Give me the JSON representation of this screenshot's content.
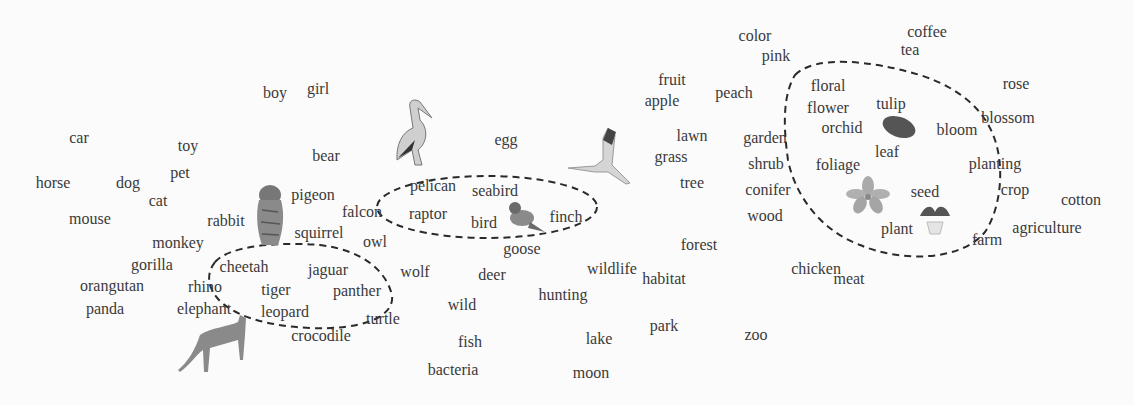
{
  "figure": {
    "type": "word-embedding-map",
    "clusters": [
      {
        "name": "big-cats",
        "members": [
          "cheetah",
          "jaguar",
          "tiger",
          "panther",
          "leopard"
        ]
      },
      {
        "name": "birds",
        "members": [
          "pelican",
          "seabird",
          "raptor",
          "bird",
          "finch"
        ]
      },
      {
        "name": "plants",
        "members": [
          "floral",
          "flower",
          "tulip",
          "orchid",
          "bloom",
          "leaf",
          "foliage",
          "seed",
          "plant"
        ]
      }
    ],
    "words": [
      {
        "text": "color",
        "x": 755,
        "y": 36
      },
      {
        "text": "pink",
        "x": 776,
        "y": 56
      },
      {
        "text": "coffee",
        "x": 927,
        "y": 32
      },
      {
        "text": "tea",
        "x": 910,
        "y": 50
      },
      {
        "text": "boy",
        "x": 275,
        "y": 93
      },
      {
        "text": "girl",
        "x": 318,
        "y": 89
      },
      {
        "text": "fruit",
        "x": 672,
        "y": 80
      },
      {
        "text": "apple",
        "x": 662,
        "y": 101
      },
      {
        "text": "peach",
        "x": 734,
        "y": 93
      },
      {
        "text": "rose",
        "x": 1016,
        "y": 84
      },
      {
        "text": "floral",
        "x": 828,
        "y": 86
      },
      {
        "text": "flower",
        "x": 828,
        "y": 108
      },
      {
        "text": "tulip",
        "x": 891,
        "y": 104
      },
      {
        "text": "orchid",
        "x": 842,
        "y": 128
      },
      {
        "text": "bloom",
        "x": 957,
        "y": 130
      },
      {
        "text": "blossom",
        "x": 1008,
        "y": 118
      },
      {
        "text": "car",
        "x": 79,
        "y": 138
      },
      {
        "text": "toy",
        "x": 188,
        "y": 146
      },
      {
        "text": "egg",
        "x": 506,
        "y": 140
      },
      {
        "text": "lawn",
        "x": 692,
        "y": 136
      },
      {
        "text": "garden",
        "x": 765,
        "y": 138
      },
      {
        "text": "bear",
        "x": 326,
        "y": 156
      },
      {
        "text": "grass",
        "x": 671,
        "y": 157
      },
      {
        "text": "shrub",
        "x": 766,
        "y": 164
      },
      {
        "text": "leaf",
        "x": 887,
        "y": 152
      },
      {
        "text": "foliage",
        "x": 838,
        "y": 165
      },
      {
        "text": "planting",
        "x": 995,
        "y": 164
      },
      {
        "text": "horse",
        "x": 53,
        "y": 183
      },
      {
        "text": "dog",
        "x": 128,
        "y": 183
      },
      {
        "text": "pet",
        "x": 180,
        "y": 173
      },
      {
        "text": "tree",
        "x": 692,
        "y": 183
      },
      {
        "text": "pigeon",
        "x": 313,
        "y": 195
      },
      {
        "text": "pelican",
        "x": 433,
        "y": 186
      },
      {
        "text": "seabird",
        "x": 495,
        "y": 191
      },
      {
        "text": "conifer",
        "x": 768,
        "y": 190
      },
      {
        "text": "seed",
        "x": 925,
        "y": 192
      },
      {
        "text": "crop",
        "x": 1015,
        "y": 190
      },
      {
        "text": "cotton",
        "x": 1081,
        "y": 200
      },
      {
        "text": "cat",
        "x": 158,
        "y": 201
      },
      {
        "text": "falcon",
        "x": 362,
        "y": 212
      },
      {
        "text": "raptor",
        "x": 428,
        "y": 214
      },
      {
        "text": "bird",
        "x": 484,
        "y": 223
      },
      {
        "text": "finch",
        "x": 566,
        "y": 217
      },
      {
        "text": "mouse",
        "x": 90,
        "y": 219
      },
      {
        "text": "rabbit",
        "x": 226,
        "y": 221
      },
      {
        "text": "wood",
        "x": 765,
        "y": 216
      },
      {
        "text": "plant",
        "x": 897,
        "y": 229
      },
      {
        "text": "agriculture",
        "x": 1047,
        "y": 228
      },
      {
        "text": "squirrel",
        "x": 319,
        "y": 233
      },
      {
        "text": "farm",
        "x": 987,
        "y": 240
      },
      {
        "text": "monkey",
        "x": 178,
        "y": 243
      },
      {
        "text": "owl",
        "x": 375,
        "y": 242
      },
      {
        "text": "forest",
        "x": 699,
        "y": 245
      },
      {
        "text": "goose",
        "x": 522,
        "y": 249
      },
      {
        "text": "gorilla",
        "x": 152,
        "y": 265
      },
      {
        "text": "cheetah",
        "x": 244,
        "y": 267
      },
      {
        "text": "jaguar",
        "x": 328,
        "y": 270
      },
      {
        "text": "wolf",
        "x": 415,
        "y": 272
      },
      {
        "text": "deer",
        "x": 492,
        "y": 275
      },
      {
        "text": "wildlife",
        "x": 612,
        "y": 269
      },
      {
        "text": "habitat",
        "x": 664,
        "y": 279
      },
      {
        "text": "chicken",
        "x": 816,
        "y": 269
      },
      {
        "text": "meat",
        "x": 849,
        "y": 279
      },
      {
        "text": "orangutan",
        "x": 112,
        "y": 286
      },
      {
        "text": "rhino",
        "x": 205,
        "y": 287
      },
      {
        "text": "tiger",
        "x": 276,
        "y": 290
      },
      {
        "text": "panther",
        "x": 357,
        "y": 291
      },
      {
        "text": "hunting",
        "x": 563,
        "y": 295
      },
      {
        "text": "wild",
        "x": 462,
        "y": 305
      },
      {
        "text": "panda",
        "x": 105,
        "y": 309
      },
      {
        "text": "elephant",
        "x": 204,
        "y": 309
      },
      {
        "text": "leopard",
        "x": 285,
        "y": 312
      },
      {
        "text": "turtle",
        "x": 383,
        "y": 319
      },
      {
        "text": "park",
        "x": 664,
        "y": 326
      },
      {
        "text": "zoo",
        "x": 756,
        "y": 335
      },
      {
        "text": "crocodile",
        "x": 321,
        "y": 336
      },
      {
        "text": "fish",
        "x": 470,
        "y": 342
      },
      {
        "text": "lake",
        "x": 599,
        "y": 339
      },
      {
        "text": "bacteria",
        "x": 453,
        "y": 370
      },
      {
        "text": "moon",
        "x": 591,
        "y": 373
      }
    ],
    "images": [
      {
        "name": "pelican-image",
        "x": 395,
        "y": 100,
        "w": 38,
        "h": 68
      },
      {
        "name": "tiger-image",
        "x": 253,
        "y": 183,
        "w": 35,
        "h": 65
      },
      {
        "name": "cheetah-image",
        "x": 175,
        "y": 315,
        "w": 72,
        "h": 62
      },
      {
        "name": "sparrow-image",
        "x": 507,
        "y": 202,
        "w": 40,
        "h": 32
      },
      {
        "name": "crane-image",
        "x": 565,
        "y": 127,
        "w": 68,
        "h": 58
      },
      {
        "name": "leaf-image",
        "x": 880,
        "y": 114,
        "w": 38,
        "h": 26
      },
      {
        "name": "orchid-image",
        "x": 847,
        "y": 177,
        "w": 42,
        "h": 38
      },
      {
        "name": "potted-plant-image",
        "x": 918,
        "y": 203,
        "w": 34,
        "h": 32
      }
    ],
    "colors": {
      "text": "#3a3a3a",
      "outline": "#2a2a2a",
      "background": "#fbfbfb"
    }
  }
}
